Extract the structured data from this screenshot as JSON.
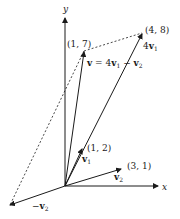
{
  "diagram": {
    "type": "vector-diagram",
    "axes": {
      "x_label": "x",
      "y_label": "y"
    },
    "points": {
      "p17": "(1, 7)",
      "p48": "(4, 8)",
      "p12": "(1, 2)",
      "p31": "(3, 1)"
    },
    "vectors": {
      "v1": {
        "name": "v",
        "sub": "1",
        "to": "(1, 2)"
      },
      "v2": {
        "name": "v",
        "sub": "2",
        "to": "(3, 1)"
      },
      "neg_v2": {
        "prefix": "−",
        "name": "v",
        "sub": "2"
      },
      "four_v1": {
        "coef": "4",
        "name": "v",
        "sub": "1",
        "to": "(4, 8)"
      },
      "v": {
        "lhs": "v",
        "eq": " = 4",
        "name1": "v",
        "sub1": "1",
        "minus": " − ",
        "name2": "v",
        "sub2": "2",
        "to": "(1, 7)"
      }
    },
    "colors": {
      "ink": "#1a1a1a",
      "background": "#ffffff"
    }
  }
}
